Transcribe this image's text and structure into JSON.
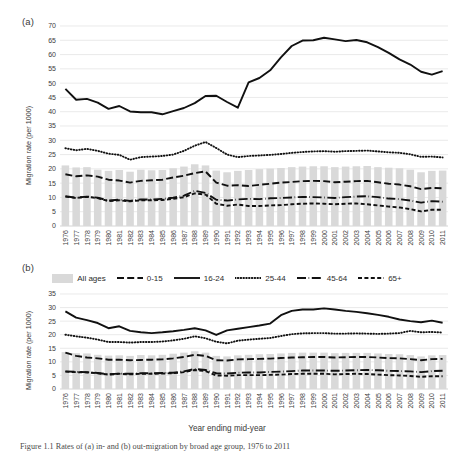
{
  "figure": {
    "panel_a_label": "(a)",
    "panel_b_label": "(b)",
    "xlabel": "Year ending mid-year",
    "caption": "Figure 1.1 Rates of (a) in- and (b) out-migration by broad age group, 1976 to 2011"
  },
  "legend": {
    "items": [
      {
        "label": "All ages",
        "style": "bar",
        "color": "#d9d9d9"
      },
      {
        "label": "0-15",
        "style": "dashed",
        "color": "#111111"
      },
      {
        "label": "16-24",
        "style": "solid",
        "color": "#111111"
      },
      {
        "label": "25-44",
        "style": "dotted",
        "color": "#111111"
      },
      {
        "label": "45-64",
        "style": "dash-dot",
        "color": "#111111"
      },
      {
        "label": "65+",
        "style": "short-dash",
        "color": "#111111"
      }
    ]
  },
  "chart_data": [
    {
      "id": "panel-a",
      "type": "line",
      "title": "(a)",
      "xlabel": "Year ending mid-year",
      "ylabel": "Migration rate (per 1000)",
      "ylim": [
        0,
        70
      ],
      "ytick_step": 5,
      "yticks": [
        0,
        5,
        10,
        15,
        20,
        25,
        30,
        35,
        40,
        45,
        50,
        55,
        60,
        65,
        70
      ],
      "grid": true,
      "legend_position": "between-panels",
      "categories": [
        "1976",
        "1977",
        "1978",
        "1979",
        "1980",
        "1981",
        "1982",
        "1983",
        "1984",
        "1985",
        "1986",
        "1987",
        "1988",
        "1989",
        "1990",
        "1991",
        "1992",
        "1993",
        "1994",
        "1995",
        "1996",
        "1997",
        "1998",
        "1999",
        "2000",
        "2001",
        "2002",
        "2003",
        "2004",
        "2005",
        "2006",
        "2007",
        "2008",
        "2009",
        "2010",
        "2011"
      ],
      "series": [
        {
          "name": "All ages",
          "type": "bar",
          "values": [
            21.2,
            20.5,
            20.6,
            19.7,
            19.3,
            19.6,
            19.0,
            19.7,
            19.5,
            19.6,
            20.2,
            20.8,
            21.6,
            21.2,
            19.4,
            18.8,
            19.3,
            19.6,
            19.9,
            20.1,
            20.3,
            20.6,
            20.8,
            20.9,
            20.9,
            20.6,
            20.8,
            20.9,
            21.0,
            20.6,
            20.4,
            20.2,
            19.7,
            18.8,
            19.3,
            19.4
          ]
        },
        {
          "name": "0-15",
          "type": "line",
          "values": [
            18.1,
            17.4,
            17.7,
            17.3,
            16.2,
            15.9,
            15.2,
            15.8,
            16.0,
            16.2,
            17.0,
            17.6,
            18.5,
            19.1,
            15.2,
            14.1,
            14.3,
            14.0,
            14.4,
            14.8,
            15.2,
            15.4,
            15.7,
            15.8,
            15.7,
            15.3,
            15.5,
            15.7,
            15.8,
            15.3,
            14.8,
            14.5,
            13.9,
            12.9,
            13.3,
            13.2
          ]
        },
        {
          "name": "16-24",
          "type": "line",
          "values": [
            48.0,
            44.2,
            44.5,
            43.2,
            41.0,
            42.0,
            40.1,
            39.8,
            39.8,
            39.1,
            40.2,
            41.3,
            43.0,
            45.5,
            45.6,
            43.4,
            41.4,
            50.3,
            51.8,
            54.5,
            59.0,
            63.0,
            64.9,
            65.0,
            65.9,
            65.3,
            64.7,
            65.1,
            64.3,
            62.6,
            60.6,
            58.3,
            56.5,
            54.0,
            53.0,
            54.2,
            53.5
          ]
        },
        {
          "name": "25-44",
          "type": "line",
          "values": [
            27.2,
            26.5,
            27.0,
            26.3,
            25.3,
            24.9,
            23.2,
            24.1,
            24.3,
            24.5,
            25.0,
            26.3,
            28.1,
            29.4,
            27.3,
            25.0,
            24.1,
            24.5,
            24.7,
            24.9,
            25.2,
            25.6,
            25.9,
            26.1,
            26.2,
            26.0,
            26.2,
            26.3,
            26.4,
            26.1,
            25.8,
            25.6,
            25.1,
            24.2,
            24.3,
            24.0
          ]
        },
        {
          "name": "45-64",
          "type": "line",
          "values": [
            10.4,
            9.9,
            10.3,
            9.9,
            8.9,
            9.2,
            8.8,
            9.3,
            9.3,
            9.5,
            9.9,
            10.6,
            12.3,
            11.6,
            9.2,
            8.9,
            9.3,
            9.5,
            9.4,
            9.7,
            9.8,
            10.0,
            10.2,
            10.1,
            10.0,
            9.8,
            10.1,
            10.3,
            10.4,
            10.1,
            9.6,
            9.4,
            8.9,
            8.2,
            8.7,
            8.5
          ]
        },
        {
          "name": "65+",
          "type": "line",
          "values": [
            10.3,
            9.8,
            10.2,
            9.8,
            8.7,
            9.0,
            8.6,
            9.0,
            9.0,
            9.1,
            9.5,
            10.1,
            11.4,
            11.0,
            7.8,
            7.1,
            7.5,
            7.0,
            7.0,
            7.2,
            7.3,
            7.6,
            7.8,
            7.9,
            7.8,
            7.6,
            7.8,
            7.9,
            7.6,
            7.2,
            6.8,
            6.5,
            5.9,
            5.1,
            5.7,
            5.7
          ]
        }
      ]
    },
    {
      "id": "panel-b",
      "type": "line",
      "title": "(b)",
      "xlabel": "Year ending mid-year",
      "ylabel": "Migration rate (per 1000)",
      "ylim": [
        0,
        35
      ],
      "ytick_step": 5,
      "yticks": [
        0,
        5,
        10,
        15,
        20,
        25,
        30,
        35
      ],
      "grid": true,
      "categories": [
        "1976",
        "1977",
        "1978",
        "1979",
        "1980",
        "1981",
        "1982",
        "1983",
        "1984",
        "1985",
        "1986",
        "1987",
        "1988",
        "1989",
        "1990",
        "1991",
        "1992",
        "1993",
        "1994",
        "1995",
        "1996",
        "1997",
        "1998",
        "1999",
        "2000",
        "2001",
        "2002",
        "2003",
        "2004",
        "2005",
        "2006",
        "2007",
        "2008",
        "2009",
        "2010",
        "2011"
      ],
      "series": [
        {
          "name": "All ages",
          "type": "bar",
          "values": [
            13.6,
            13.2,
            13.1,
            12.6,
            12.3,
            12.4,
            12.2,
            12.5,
            12.4,
            12.6,
            13.0,
            13.4,
            13.9,
            13.4,
            12.2,
            12.0,
            12.4,
            12.6,
            12.8,
            12.9,
            13.1,
            13.3,
            13.4,
            13.4,
            13.4,
            13.2,
            13.3,
            13.3,
            13.3,
            13.1,
            12.9,
            12.8,
            12.5,
            12.0,
            12.4,
            12.5
          ]
        },
        {
          "name": "0-15",
          "type": "line",
          "values": [
            13.4,
            12.2,
            11.6,
            11.3,
            10.8,
            10.8,
            10.6,
            10.7,
            10.8,
            10.9,
            11.3,
            11.8,
            12.6,
            12.2,
            10.6,
            10.5,
            10.9,
            11.0,
            11.1,
            11.2,
            11.4,
            11.6,
            11.7,
            11.8,
            11.8,
            11.6,
            11.7,
            11.8,
            11.8,
            11.6,
            11.4,
            11.3,
            11.0,
            10.6,
            11.0,
            11.1
          ]
        },
        {
          "name": "16-24",
          "type": "line",
          "values": [
            28.6,
            26.3,
            25.4,
            24.3,
            22.4,
            23.1,
            21.4,
            20.9,
            20.6,
            20.9,
            21.3,
            21.8,
            22.4,
            21.6,
            19.9,
            21.6,
            22.2,
            22.8,
            23.4,
            24.1,
            27.2,
            28.8,
            29.3,
            29.3,
            29.7,
            29.3,
            28.8,
            28.4,
            27.9,
            27.3,
            26.6,
            25.6,
            25.0,
            24.6,
            25.2,
            24.4
          ]
        },
        {
          "name": "25-44",
          "type": "line",
          "values": [
            20.0,
            19.4,
            18.9,
            18.2,
            17.3,
            17.3,
            17.1,
            17.3,
            17.3,
            17.5,
            17.9,
            18.5,
            19.4,
            18.7,
            17.4,
            16.8,
            17.8,
            18.2,
            18.5,
            18.8,
            19.5,
            20.2,
            20.5,
            20.6,
            20.6,
            20.4,
            20.4,
            20.5,
            20.4,
            20.3,
            20.4,
            20.6,
            21.4,
            20.9,
            21.0,
            20.8
          ]
        },
        {
          "name": "45-64",
          "type": "line",
          "values": [
            6.5,
            6.3,
            6.2,
            5.9,
            5.4,
            5.7,
            5.6,
            5.8,
            5.8,
            5.9,
            6.0,
            6.5,
            7.4,
            7.0,
            5.8,
            5.7,
            6.0,
            6.1,
            6.1,
            6.3,
            6.4,
            6.6,
            6.8,
            6.8,
            6.8,
            6.7,
            6.8,
            6.9,
            7.0,
            6.9,
            6.7,
            6.6,
            6.5,
            6.2,
            6.6,
            6.7
          ]
        },
        {
          "name": "65+",
          "type": "line",
          "values": [
            6.4,
            6.2,
            6.1,
            5.8,
            5.3,
            5.6,
            5.4,
            5.6,
            5.6,
            5.7,
            5.8,
            6.2,
            7.0,
            6.6,
            5.0,
            4.9,
            5.1,
            5.1,
            5.1,
            5.2,
            5.3,
            5.5,
            5.6,
            5.6,
            5.6,
            5.4,
            5.5,
            5.6,
            5.5,
            5.3,
            5.1,
            5.0,
            4.8,
            4.5,
            4.7,
            4.7
          ]
        }
      ]
    }
  ]
}
